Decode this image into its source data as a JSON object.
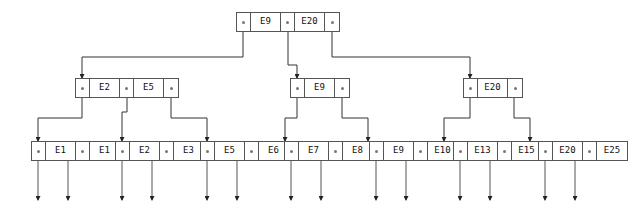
{
  "diagram": {
    "colors": {
      "border": "#555555",
      "line": "#333333",
      "pointer_dot": "#777777",
      "background": "#ffffff"
    },
    "pointer_symbol": "•"
  },
  "tree": {
    "root": {
      "name": "root-node",
      "keys": [
        "E9",
        "E20"
      ],
      "pointer_count": 3
    },
    "internal": [
      {
        "name": "internal-node-left",
        "keys": [
          "E2",
          "E5"
        ],
        "pointer_count": 3
      },
      {
        "name": "internal-node-middle",
        "keys": [
          "E9"
        ],
        "pointer_count": 2
      },
      {
        "name": "internal-node-right",
        "keys": [
          "E20"
        ],
        "pointer_count": 2
      }
    ],
    "leaves": [
      {
        "name": "leaf-node-1",
        "keys": [
          "E1",
          "E1"
        ],
        "pointer_count": 3
      },
      {
        "name": "leaf-node-2",
        "keys": [
          "E2",
          "E3"
        ],
        "pointer_count": 3
      },
      {
        "name": "leaf-node-3",
        "keys": [
          "E5",
          "E6"
        ],
        "pointer_count": 3
      },
      {
        "name": "leaf-node-4",
        "keys": [
          "E7",
          "E8"
        ],
        "pointer_count": 3
      },
      {
        "name": "leaf-node-5",
        "keys": [
          "E9",
          "E10"
        ],
        "pointer_count": 3
      },
      {
        "name": "leaf-node-6",
        "keys": [
          "E13",
          "E15"
        ],
        "pointer_count": 3
      },
      {
        "name": "leaf-node-7",
        "keys": [
          "E20",
          "E25"
        ],
        "pointer_count": 3
      }
    ]
  },
  "labels": {
    "root_key_0": "E9",
    "root_key_1": "E20",
    "internal_0_key_0": "E2",
    "internal_0_key_1": "E5",
    "internal_1_key_0": "E9",
    "internal_2_key_0": "E20",
    "leaf_0_key_0": "E1",
    "leaf_0_key_1": "E1",
    "leaf_1_key_0": "E2",
    "leaf_1_key_1": "E3",
    "leaf_2_key_0": "E5",
    "leaf_2_key_1": "E6",
    "leaf_3_key_0": "E7",
    "leaf_3_key_1": "E8",
    "leaf_4_key_0": "E9",
    "leaf_4_key_1": "E10",
    "leaf_5_key_0": "E13",
    "leaf_5_key_1": "E15",
    "leaf_6_key_0": "E20",
    "leaf_6_key_1": "E25"
  }
}
